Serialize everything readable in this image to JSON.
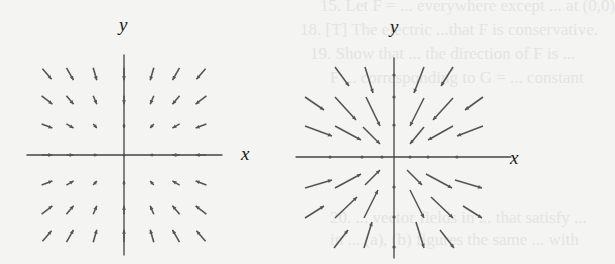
{
  "ghost_text": [
    {
      "text": "15. Let  F = ... everywhere except ... at (0,0)",
      "x": 320,
      "y": -4
    },
    {
      "text": "18. [T] The electric ...that  F  is conservative.",
      "x": 300,
      "y": 20
    },
    {
      "text": "19. Show that ... the direction of F is ...",
      "x": 310,
      "y": 44
    },
    {
      "text": "F ... corresponding to G = ... constant",
      "x": 330,
      "y": 68
    },
    {
      "text": "20. ... vector fields in ... that satisfy ...",
      "x": 330,
      "y": 208
    },
    {
      "text": "in ... (a), (b) figures the same ... with",
      "x": 330,
      "y": 230
    }
  ],
  "left_plot": {
    "name": "vector-field-left",
    "origin": [
      124,
      155
    ],
    "x_label": "x",
    "y_label": "y",
    "x_axis": [
      27,
      222
    ],
    "y_axis": [
      55,
      255
    ],
    "grid_x": [
      47,
      70,
      95,
      124,
      152,
      176,
      201
    ],
    "grid_y": [
      74,
      100,
      126,
      155,
      183,
      210,
      236
    ],
    "description": "Arrows point inward toward the x-axis and y-axis origin; vertical component dominates far from x-axis"
  },
  "right_plot": {
    "name": "vector-field-right",
    "origin": [
      394,
      157
    ],
    "x_label": "x",
    "y_label": "y",
    "x_axis": [
      296,
      511
    ],
    "y_axis": [
      58,
      258
    ],
    "grid_x": [
      330,
      362,
      382,
      394,
      410,
      428,
      457
    ],
    "grid_y": [
      75,
      97,
      125,
      157,
      187,
      217,
      247
    ],
    "description": "Radial arrows all pointing toward the origin"
  },
  "colors": {
    "arrow": "#555555",
    "axis": "#444444",
    "label": "#1a1a1a"
  }
}
